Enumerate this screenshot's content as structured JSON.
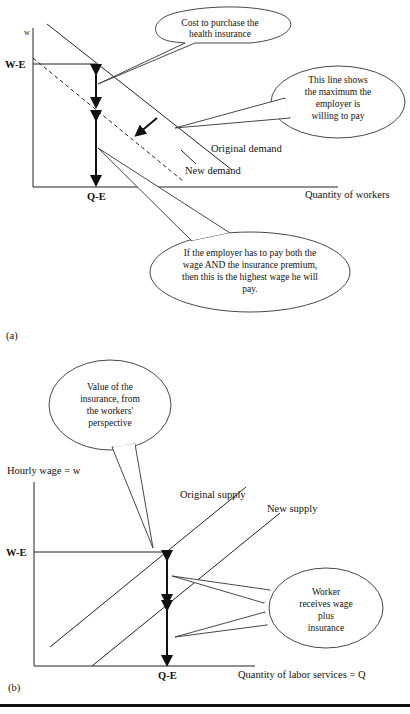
{
  "panel_a": {
    "caption": "(a)",
    "y_axis_label": "w",
    "x_axis_label": "Quantity of workers",
    "wage_marker": "W-E",
    "quantity_marker": "Q-E",
    "curves": {
      "original": "Original demand",
      "new": "New demand"
    },
    "callouts": {
      "cost": [
        "Cost to purchase the",
        "health insurance"
      ],
      "max": [
        "This line shows",
        "the maximum the",
        "employer is",
        "willing to pay"
      ],
      "highest": [
        "If the employer has to pay both the",
        "wage AND the insurance premium,",
        "then this is the highest wage he will",
        "pay."
      ]
    }
  },
  "panel_b": {
    "caption": "(b)",
    "y_axis_label": "Hourly wage = w",
    "x_axis_label": "Quantity of labor services = Q",
    "wage_marker": "W-E",
    "quantity_marker": "Q-E",
    "curves": {
      "original": "Original supply",
      "new": "New supply"
    },
    "callouts": {
      "value": [
        "Value of the",
        "insurance, from",
        "the workers'",
        "perspective"
      ],
      "worker": [
        "Worker",
        "receives wage",
        "plus",
        "insurance"
      ]
    }
  }
}
